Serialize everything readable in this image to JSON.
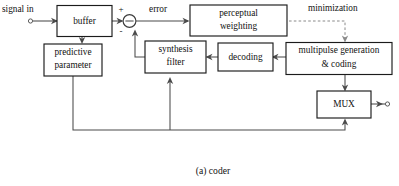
{
  "figure": {
    "caption": "(a)  coder",
    "type": "block-diagram"
  },
  "labels": {
    "signal_in": "signal in",
    "error": "error",
    "minimization": "minimization",
    "plus_sign": "+",
    "minus_sign": "-"
  },
  "blocks": {
    "buffer": {
      "line1": "buffer",
      "line2": ""
    },
    "predictive_parameter": {
      "line1": "predictive",
      "line2": "parameter"
    },
    "perceptual_weighting": {
      "line1": "perceptual",
      "line2": "weighting"
    },
    "synthesis_filter": {
      "line1": "synthesis",
      "line2": "filter"
    },
    "decoding": {
      "line1": "decoding",
      "line2": ""
    },
    "multipulse": {
      "line1": "multipulse generation",
      "line2": "& coding"
    },
    "mux": {
      "line1": "MUX",
      "line2": ""
    }
  },
  "colors": {
    "background": "#ffffff",
    "box_stroke": "#1b1b1b",
    "wire": "#4a4a4a",
    "dashed_wire": "#8a8a8a",
    "text": "#111111"
  }
}
